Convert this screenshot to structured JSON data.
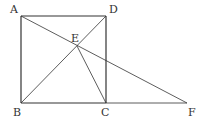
{
  "diagram": {
    "type": "geometry",
    "stroke_color": "#333333",
    "points": {
      "A": {
        "x": 21,
        "y": 16,
        "label": "A",
        "label_x": 10,
        "label_y": 13
      },
      "D": {
        "x": 106,
        "y": 16,
        "label": "D",
        "label_x": 109,
        "label_y": 13
      },
      "B": {
        "x": 21,
        "y": 103,
        "label": "B",
        "label_x": 13,
        "label_y": 116
      },
      "C": {
        "x": 106,
        "y": 103,
        "label": "C",
        "label_x": 101,
        "label_y": 116
      },
      "F": {
        "x": 187,
        "y": 103,
        "label": "F",
        "label_x": 188,
        "label_y": 116
      },
      "E": {
        "x": 77,
        "y": 46,
        "label": "E",
        "label_x": 71,
        "label_y": 42
      }
    },
    "segments": [
      [
        "A",
        "D"
      ],
      [
        "D",
        "C"
      ],
      [
        "C",
        "B"
      ],
      [
        "B",
        "A"
      ],
      [
        "B",
        "D"
      ],
      [
        "A",
        "F"
      ],
      [
        "E",
        "C"
      ],
      [
        "C",
        "F"
      ]
    ]
  }
}
